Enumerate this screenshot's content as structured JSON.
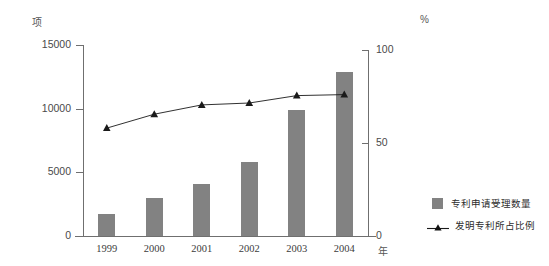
{
  "chart_data": {
    "type": "bar",
    "title": "",
    "subtitle": "",
    "categories": [
      "1999",
      "2000",
      "2001",
      "2002",
      "2003",
      "2004"
    ],
    "xlabel": "年",
    "ylabel": "项",
    "y2label": "%",
    "ylim": [
      0,
      15000
    ],
    "y2lim": [
      0,
      100
    ],
    "yticks": [
      "0",
      "5000",
      "10000",
      "15000"
    ],
    "ytick_values": [
      0,
      5000,
      10000,
      15000
    ],
    "y2ticks": [
      "0",
      "50",
      "100"
    ],
    "y2tick_values": [
      0,
      50,
      100
    ],
    "grid": false,
    "legend_position": "right-bottom",
    "series": [
      {
        "name": "专利申请受理数量",
        "type": "bar",
        "axis": "left",
        "color": "#828282",
        "values": [
          1750,
          2950,
          4050,
          5800,
          9900,
          12900
        ]
      },
      {
        "name": "发明专利所占比例",
        "type": "line",
        "axis": "right",
        "color": "#1a1a1a",
        "marker": "triangle",
        "values": [
          58,
          65.5,
          70.5,
          71.5,
          75.5,
          76
        ]
      }
    ]
  },
  "axes": {
    "left_unit": "项",
    "right_unit": "%",
    "x_unit": "年"
  },
  "legend": {
    "items": [
      {
        "label": "专利申请受理数量",
        "icon": "square-swatch"
      },
      {
        "label": "发明专利所占比例",
        "icon": "triangle-line-marker"
      }
    ]
  }
}
